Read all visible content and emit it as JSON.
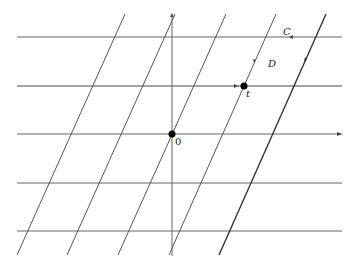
{
  "diagram": {
    "labels": {
      "C": "C",
      "D": "D",
      "t": "t",
      "origin": "0"
    },
    "colors": {
      "line": "#555555",
      "heavy": "#333333",
      "point": "#000000"
    }
  }
}
